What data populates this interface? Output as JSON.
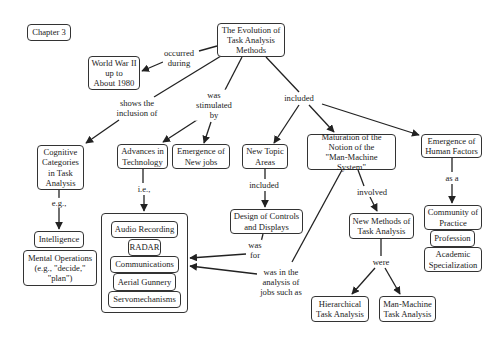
{
  "diagram": {
    "type": "concept-map",
    "chapter_tag": "Chapter 3",
    "root": "The Evolution of\nTask Analysis\nMethods",
    "nodes": {
      "wwii": "World War II\nup to\nAbout 1980",
      "cognitive": "Cognitive\nCategories\nin Task\nAnalysis",
      "advances": "Advances in\nTechnology",
      "newjobs": "Emergence of\nNew jobs",
      "newtopic": "New Topic\nAreas",
      "maturation": "Maturation of the\nNotion of the\n\"Man-Machine System\"",
      "humanfactors": "Emergence of\nHuman Factors",
      "intelligence": "Intelligence",
      "mentalops": "Mental Operations\n(e.g., \"decide,\"\n\"plan\")",
      "tech_items": [
        "Audio Recording",
        "RADAR",
        "Communications",
        "Aerial Gunnery",
        "Servomechanisms"
      ],
      "design": "Design of Controls\nand Displays",
      "newmethods": "New Methods of\nTask Analysis",
      "community": "Community of\nPractice",
      "profession": "Profession",
      "academic": "Academic\nSpecialization",
      "hierarchical": "Hierarchical\nTask Analysis",
      "manmachine": "Man-Machine\nTask Analysis"
    },
    "link_labels": {
      "occurred": "occurred\nduring",
      "shows": "shows the\ninclusion of",
      "stimulated": "was\nstimulated\nby",
      "included": "included",
      "eg": "e.g.,",
      "ie": "i.e.,",
      "included2": "included",
      "involved": "involved",
      "asa": "as a",
      "wasfor": "was\nfor",
      "wasin": "was in the\nanalysis of\njobs such as",
      "were": "were"
    }
  }
}
